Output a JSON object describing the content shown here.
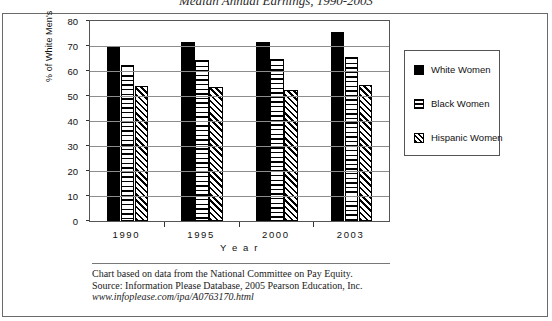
{
  "chart_data": {
    "type": "bar",
    "title": "Median Annual Earnings, 1990-2003",
    "xlabel": "Y e a r",
    "ylabel": "% of White Men's",
    "categories": [
      "1990",
      "1995",
      "2000",
      "2003"
    ],
    "ylim": [
      0,
      80
    ],
    "yticks": [
      0,
      10,
      20,
      30,
      40,
      50,
      60,
      70,
      80
    ],
    "grid": true,
    "legend_position": "right",
    "series": [
      {
        "name": "White Women",
        "pattern": "solid-black",
        "values": [
          69.5,
          71.5,
          71.8,
          75.8
        ]
      },
      {
        "name": "Black Women",
        "pattern": "horizontal-stripes",
        "values": [
          62.5,
          64.5,
          65.0,
          65.8
        ]
      },
      {
        "name": "Hispanic Women",
        "pattern": "diagonal-stripes",
        "values": [
          54.2,
          53.8,
          52.5,
          54.5
        ]
      }
    ]
  },
  "footnotes": {
    "line1": "Chart based on data from the National Committee on Pay Equity.",
    "line2": "Source:  Information Please Database, 2005 Pearson Education, Inc.",
    "line3": "www.infoplease.com/ipa/A0763170.html"
  }
}
